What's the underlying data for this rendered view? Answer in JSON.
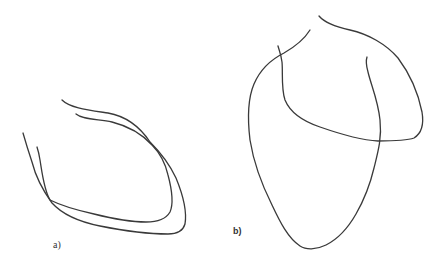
{
  "figure": {
    "background": "#ffffff",
    "stroke_color": "#3a3a3a",
    "panels": [
      {
        "id": "a",
        "label": "a)",
        "description": "Two nested open contour curves forming a U/cup shape, crossing near upper-right and lower-left"
      },
      {
        "id": "b",
        "label": "b)",
        "description": "Heart-like outline: a large closed-bottom teardrop contour overlapped by an arched contour on the upper right"
      }
    ]
  }
}
